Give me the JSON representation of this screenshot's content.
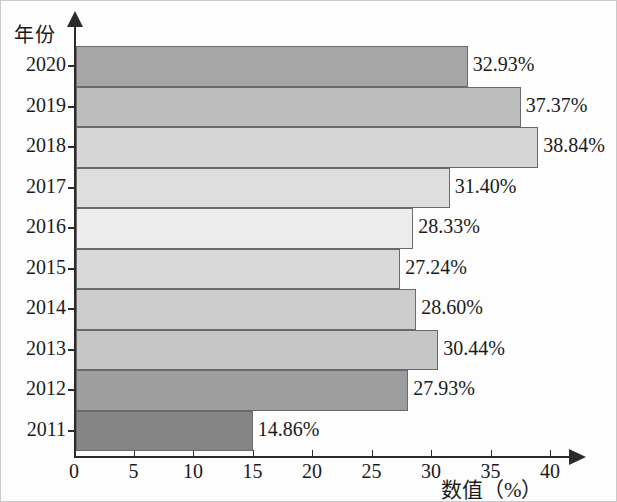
{
  "chart_data": {
    "type": "bar",
    "orientation": "horizontal",
    "title": "",
    "xlabel": "数值（%）",
    "ylabel": "年份",
    "categories": [
      "2020",
      "2019",
      "2018",
      "2017",
      "2016",
      "2015",
      "2014",
      "2013",
      "2012",
      "2011"
    ],
    "values": [
      32.93,
      37.37,
      38.84,
      31.4,
      28.33,
      27.24,
      28.6,
      30.44,
      27.93,
      14.86
    ],
    "value_labels": [
      "32.93%",
      "37.37%",
      "38.84%",
      "31.40%",
      "28.33%",
      "27.24%",
      "28.60%",
      "30.44%",
      "27.93%",
      "14.86%"
    ],
    "bar_colors": [
      "#a6a6a6",
      "#bdbdbd",
      "#d6d6d6",
      "#dedede",
      "#ededed",
      "#d9d9d9",
      "#cdcdcd",
      "#c6c6c6",
      "#9e9e9e",
      "#858585"
    ],
    "xlim": [
      0,
      42.5
    ],
    "xticks": [
      0,
      5,
      10,
      15,
      20,
      25,
      30,
      35,
      40
    ],
    "xtick_labels": [
      "0",
      "5",
      "10",
      "15",
      "20",
      "25",
      "30",
      "35",
      "40"
    ],
    "grid": false,
    "legend": "none",
    "axis_color": "#2b2b2b",
    "bar_edge_color": "#6a6a6a"
  }
}
